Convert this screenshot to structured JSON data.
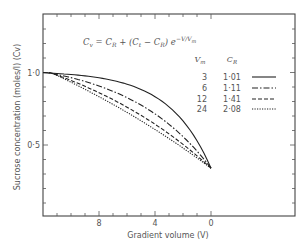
{
  "chart_data": {
    "type": "line",
    "title": "",
    "equation": "C_v = C_R + (C_t − C_R) e^{−V/V_m}",
    "xlabel": "Gradient volume (V)",
    "ylabel": "Sucrose concentration (moles/l) (Cv)",
    "xlim": [
      12,
      0
    ],
    "x_reversed": true,
    "ylim": [
      0,
      1.4
    ],
    "x_ticks": [
      8,
      4,
      0
    ],
    "x_tick_labels": [
      "8",
      "4",
      "0"
    ],
    "y_ticks": [
      1.0,
      0.5
    ],
    "y_tick_labels": [
      "1·0",
      "0·5"
    ],
    "grid": false,
    "legend_position": "upper right",
    "legend_headers": [
      "Vm",
      "CR"
    ],
    "C_t": 0.34,
    "x": [
      12,
      11,
      10,
      9,
      8,
      7,
      6,
      5,
      4,
      3,
      2,
      1,
      0
    ],
    "series": [
      {
        "name": "Vm=3, CR=1.01",
        "Vm": "3",
        "CR": "1·01",
        "style": "solid",
        "values": [
          0.998,
          0.998,
          0.986,
          0.978,
          0.967,
          0.949,
          0.919,
          0.881,
          0.833,
          0.764,
          0.676,
          0.529,
          0.34
        ]
      },
      {
        "name": "Vm=6, CR=1.11",
        "Vm": "6",
        "CR": "1·11",
        "style": "dash-dot",
        "values": [
          1.006,
          0.986,
          0.965,
          0.938,
          0.906,
          0.868,
          0.827,
          0.774,
          0.715,
          0.643,
          0.558,
          0.458,
          0.34
        ]
      },
      {
        "name": "Vm=12, CR=1.41",
        "Vm": "12",
        "CR": "1·41",
        "style": "dashed",
        "values": [
          1.016,
          0.975,
          0.93,
          0.885,
          0.836,
          0.783,
          0.761,
          0.672,
          0.613,
          0.577,
          0.478,
          0.412,
          0.34
        ]
      },
      {
        "name": "Vm=24, CR=2.08",
        "Vm": "24",
        "CR": "2·08",
        "style": "dotted",
        "values": [
          1.025,
          0.984,
          0.929,
          0.88,
          0.83,
          0.777,
          0.724,
          0.668,
          0.61,
          0.552,
          0.475,
          0.408,
          0.34
        ]
      }
    ]
  }
}
